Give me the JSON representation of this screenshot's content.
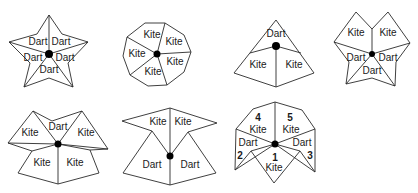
{
  "figures": [
    {
      "id": "sun",
      "tiles": [
        "Dart",
        "Dart",
        "Dart",
        "Dart",
        "Dart"
      ]
    },
    {
      "id": "star-decagon",
      "tiles": [
        "Kite",
        "Kite",
        "Kite",
        "Kite",
        "Kite"
      ]
    },
    {
      "id": "ace",
      "tiles": [
        "Dart",
        "Kite",
        "Kite"
      ]
    },
    {
      "id": "deuce",
      "tiles": [
        "Kite",
        "Kite",
        "Dart",
        "Dart",
        "Dart"
      ]
    },
    {
      "id": "jack",
      "tiles": [
        "Kite",
        "Dart",
        "Kite",
        "Kite",
        "Kite"
      ]
    },
    {
      "id": "queen",
      "tiles": [
        "Kite",
        "Kite",
        "Dart",
        "Dart"
      ]
    },
    {
      "id": "king",
      "tiles": [
        "Kite",
        "Kite",
        "Dart",
        "Dart",
        "Kite"
      ],
      "numbers": [
        "4",
        "5",
        "2",
        "3",
        "1"
      ]
    }
  ]
}
